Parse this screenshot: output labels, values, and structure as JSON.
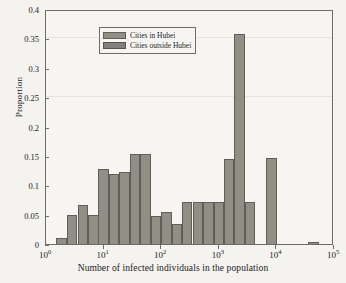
{
  "chart_data": {
    "type": "bar",
    "title": "",
    "xlabel": "Number of infected individuals in the population",
    "ylabel": "Proportion",
    "xscale": "log",
    "xlim": [
      1,
      100000
    ],
    "ylim": [
      0,
      0.4
    ],
    "yticks": [
      0,
      0.05,
      0.1,
      0.15,
      0.2,
      0.25,
      0.3,
      0.35,
      0.4
    ],
    "ytick_labels": [
      "0",
      "0.05",
      "0.1",
      "0.15",
      "0.2",
      "0.25",
      "0.3",
      "0.35",
      "0.4"
    ],
    "xticks": [
      1,
      10,
      100,
      1000,
      10000,
      100000
    ],
    "xtick_labels": [
      "10^0",
      "10^1",
      "10^2",
      "10^3",
      "10^4",
      "10^5"
    ],
    "xtick_mantissa": [
      "10",
      "10",
      "10",
      "10",
      "10",
      "10"
    ],
    "xtick_exponent": [
      "0",
      "1",
      "2",
      "3",
      "4",
      "5"
    ],
    "grid": false,
    "legend_position": "upper left",
    "bin_width_decades": 0.1818,
    "series": [
      {
        "name": "Cities in Hubei",
        "color": "#918e85",
        "edge_color": "#5f5d57",
        "bin_left_decades": [
          0.18,
          0.36,
          0.55,
          0.73,
          0.91,
          1.09,
          1.27,
          1.45,
          1.64,
          1.82,
          2.0,
          2.18,
          2.36,
          2.55,
          2.73,
          2.91,
          3.09,
          3.27,
          3.45,
          3.64,
          3.82,
          4.36,
          4.55
        ],
        "values": [
          0.0095,
          0.0488,
          0.0672,
          0.05,
          0.1281,
          0.1196,
          0.122,
          0.1535,
          0.1535,
          0.0476,
          0.0549,
          0.0342,
          0.072,
          0.072,
          0.072,
          0.072,
          0.1452,
          0.3573,
          0.072,
          0.0,
          0.1459,
          0.0,
          0.003
        ]
      },
      {
        "name": "Cities outside Hubei",
        "color": "#82807a",
        "edge_color": "#555450",
        "bin_left_decades": [
          2.36,
          2.55,
          2.73,
          2.91,
          3.09
        ],
        "values": [
          0.0045,
          0.004,
          0.004,
          0.004,
          0.004
        ]
      }
    ]
  },
  "legend": {
    "items": [
      {
        "label": "Cities in Hubei"
      },
      {
        "label": "Cities outside Hubei"
      }
    ]
  }
}
